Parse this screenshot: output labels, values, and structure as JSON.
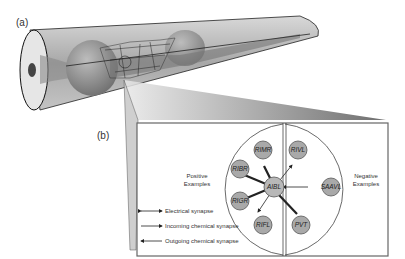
{
  "panels": {
    "a_label": "(a)",
    "b_label": "(b)"
  },
  "groups": {
    "positive": [
      "Positive",
      "Examples"
    ],
    "negative": [
      "Negative",
      "Examples"
    ]
  },
  "nodes": {
    "center": "AIBL",
    "positive": [
      "RIMR",
      "RIBR",
      "RIGR",
      "RIFL"
    ],
    "negative": [
      "RIVL",
      "SAAVL",
      "PVT"
    ]
  },
  "legend": [
    {
      "label": "Electrical synapse"
    },
    {
      "label": "Incoming chemical synapse"
    },
    {
      "label": "Outgoing chemical synapse"
    }
  ],
  "colors": {
    "node_fill": "#a9a9a9",
    "node_stroke": "#555555",
    "box_stroke": "#666666"
  }
}
